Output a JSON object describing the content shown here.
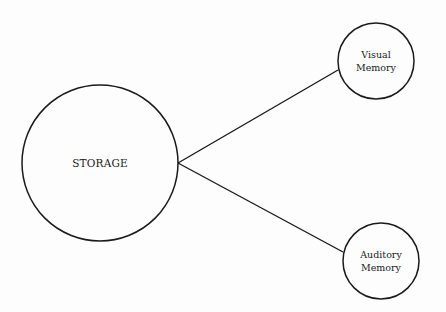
{
  "diagram": {
    "stroke_color": "#1a1a1a",
    "background": "#fdfdfd",
    "nodes": [
      {
        "id": "storage",
        "label": "STORAGE",
        "cx": 100,
        "cy": 163,
        "r": 78
      },
      {
        "id": "visual-memory",
        "label": "Visual\nMemory",
        "cx": 376,
        "cy": 61,
        "r": 38
      },
      {
        "id": "auditory-memory",
        "label": "Auditory\nMemory",
        "cx": 381,
        "cy": 261,
        "r": 38
      }
    ],
    "edges": [
      {
        "from": "storage",
        "to": "visual-memory",
        "x1": 178,
        "y1": 163,
        "x2": 338,
        "y2": 70
      },
      {
        "from": "storage",
        "to": "auditory-memory",
        "x1": 178,
        "y1": 163,
        "x2": 343,
        "y2": 252
      }
    ]
  }
}
